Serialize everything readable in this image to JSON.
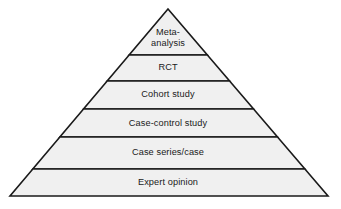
{
  "figure": {
    "name": "evidence-pyramid",
    "type": "pyramid-hierarchy-diagram",
    "background_color": "#ffffff",
    "fill_color": "#f0f0f0",
    "stroke_color": "#1a1a1a",
    "text_color": "#1a1a1a",
    "apex": {
      "x": 168,
      "y": 9
    },
    "base_left": {
      "x": 10,
      "y": 196
    },
    "base_right": {
      "x": 328,
      "y": 196
    },
    "divider_y": [
      55,
      81,
      109,
      137,
      169
    ]
  },
  "tiers": [
    {
      "index": 0,
      "label": "Meta-analysis",
      "lines": [
        "Meta-",
        "analysis"
      ],
      "top_y": 9,
      "bottom_y": 55,
      "center_x": 168,
      "center_y": 38
    },
    {
      "index": 1,
      "label": "RCT",
      "lines": [
        "RCT"
      ],
      "top_y": 55,
      "bottom_y": 81,
      "center_x": 168,
      "center_y": 68
    },
    {
      "index": 2,
      "label": "Cohort study",
      "lines": [
        "Cohort study"
      ],
      "top_y": 81,
      "bottom_y": 109,
      "center_x": 168,
      "center_y": 95
    },
    {
      "index": 3,
      "label": "Case-control study",
      "lines": [
        "Case-control study"
      ],
      "top_y": 109,
      "bottom_y": 137,
      "center_x": 168,
      "center_y": 124
    },
    {
      "index": 4,
      "label": "Case series/case",
      "lines": [
        "Case series/case"
      ],
      "top_y": 137,
      "bottom_y": 169,
      "center_x": 168,
      "center_y": 153
    },
    {
      "index": 5,
      "label": "Expert opinion",
      "lines": [
        "Expert opinion"
      ],
      "top_y": 169,
      "bottom_y": 196,
      "center_x": 168,
      "center_y": 183
    }
  ]
}
